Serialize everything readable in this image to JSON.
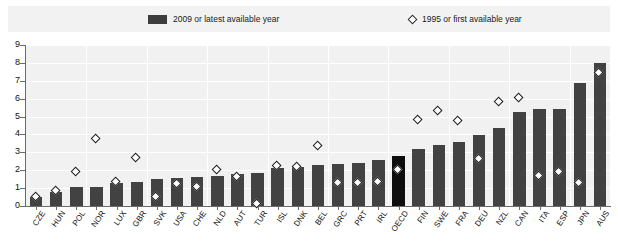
{
  "legend": {
    "bar_label": "2009 or latest available year",
    "diamond_label": "1995 or first available year",
    "bar_color": "#3d3d3d",
    "diamond_color": "#2b2b2b"
  },
  "axis": {
    "y_ticks": [
      "0",
      "1",
      "2",
      "3",
      "4",
      "5",
      "6",
      "7",
      "8",
      "9"
    ]
  },
  "colors": {
    "bar": "#424242",
    "highlight_bar": "#0e0e0e",
    "plot_background": "#f1f1f1",
    "gridline": "#ffffff",
    "axis": "#6b6b6b",
    "legend_background": "#f2f2f2"
  },
  "chart_data": {
    "type": "bar",
    "title": "",
    "subtitle": "",
    "xlabel": "",
    "ylabel": "",
    "ylim": [
      0,
      9
    ],
    "grid": true,
    "legend_position": "top",
    "categories": [
      "CZE",
      "HUN",
      "POL",
      "NOR",
      "LUX",
      "GBR",
      "SVK",
      "USA",
      "CHE",
      "NLD",
      "AUT",
      "TUR",
      "ISL",
      "DNK",
      "BEL",
      "GRC",
      "PRT",
      "IRL",
      "OECD",
      "FIN",
      "SWE",
      "FRA",
      "DEU",
      "NZL",
      "CAN",
      "ITA",
      "ESP",
      "JPN",
      "AUS"
    ],
    "highlight_category": "OECD",
    "series": [
      {
        "name": "2009 or latest available year",
        "type": "bar",
        "values": [
          0.5,
          0.8,
          1.05,
          1.05,
          1.3,
          1.35,
          1.5,
          1.55,
          1.6,
          1.7,
          1.8,
          1.85,
          2.1,
          2.2,
          2.3,
          2.35,
          2.4,
          2.55,
          2.8,
          3.2,
          3.4,
          3.6,
          3.95,
          4.35,
          5.25,
          5.4,
          5.4,
          6.9,
          8.0
        ]
      },
      {
        "name": "1995 or first available year",
        "type": "scatter-diamond",
        "values": [
          0.45,
          0.8,
          1.85,
          3.7,
          1.3,
          2.65,
          0.45,
          1.2,
          1.05,
          2.0,
          1.6,
          0.1,
          2.2,
          2.15,
          3.35,
          1.25,
          1.25,
          1.3,
          2.0,
          4.8,
          5.3,
          4.7,
          2.6,
          5.8,
          6.0,
          1.65,
          1.9,
          1.25,
          7.4
        ]
      }
    ]
  }
}
